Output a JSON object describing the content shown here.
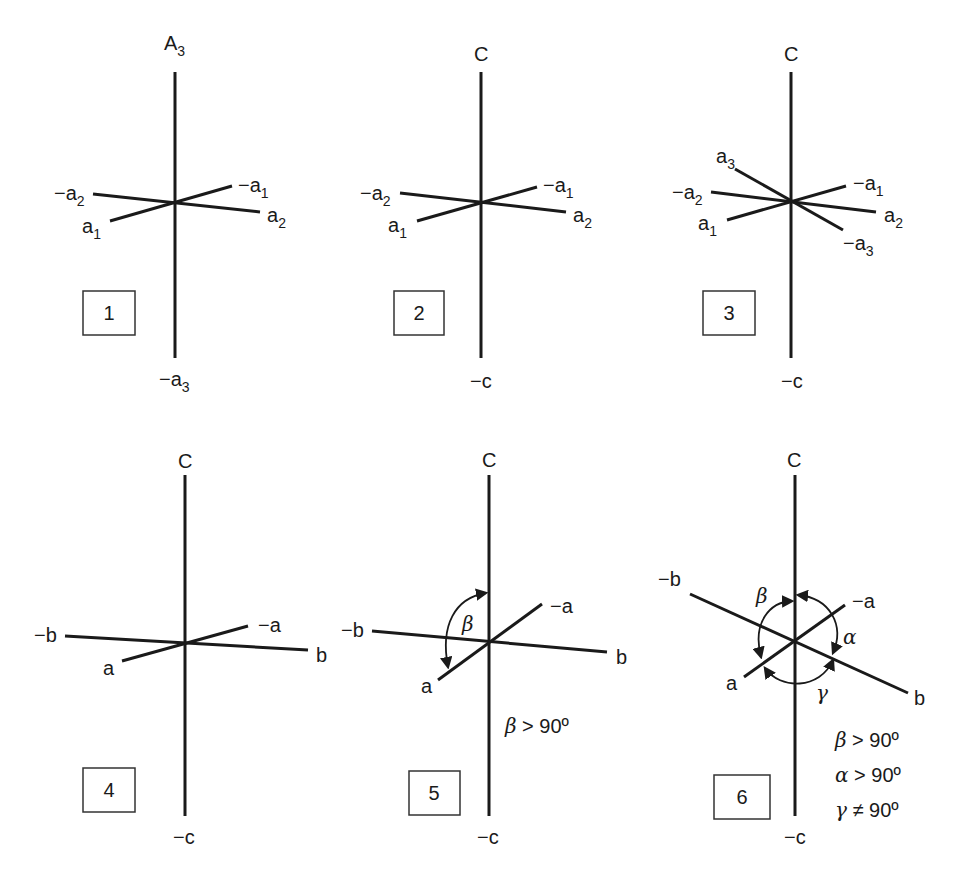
{
  "figure": {
    "panels": [
      {
        "number": "1",
        "axes": {
          "top": "A3",
          "bottom": "−a3",
          "left_upper": "−a2",
          "left_lower": "a1",
          "right_upper": "−a1",
          "right_lower": "a2"
        }
      },
      {
        "number": "2",
        "axes": {
          "top": "C",
          "bottom": "−c",
          "left_upper": "−a2",
          "left_lower": "a1",
          "right_upper": "−a1",
          "right_lower": "a2"
        }
      },
      {
        "number": "3",
        "axes": {
          "top": "C",
          "bottom": "−c",
          "upper_left": "a3",
          "left_upper": "−a2",
          "left_lower": "a1",
          "right_upper": "−a1",
          "right_mid": "a2",
          "lower_right": "−a3"
        }
      },
      {
        "number": "4",
        "axes": {
          "top": "C",
          "bottom": "−c",
          "left": "−b",
          "right": "b",
          "front": "a",
          "back": "−a"
        }
      },
      {
        "number": "5",
        "axes": {
          "top": "C",
          "bottom": "−c",
          "left": "−b",
          "right": "b",
          "front": "a",
          "back": "−a"
        },
        "angles": {
          "beta": "β"
        },
        "conditions": [
          "β > 90º"
        ]
      },
      {
        "number": "6",
        "axes": {
          "top": "C",
          "bottom": "−c",
          "left": "−b",
          "right": "b",
          "front": "a",
          "back": "−a"
        },
        "angles": {
          "beta": "β",
          "alpha": "α",
          "gamma": "γ"
        },
        "conditions": [
          "β > 90º",
          "α > 90º",
          "γ ≠ 90º"
        ]
      }
    ]
  },
  "labels": {
    "p1": {
      "top_main": "A",
      "top_sub": "3",
      "bottom_main": "−a",
      "bottom_sub": "3",
      "l1_main": "−a",
      "l1_sub": "2",
      "l2_main": "a",
      "l2_sub": "1",
      "r1_main": "−a",
      "r1_sub": "1",
      "r2_main": "a",
      "r2_sub": "2"
    },
    "p2": {
      "top": "C",
      "bottom": "−c",
      "l1_main": "−a",
      "l1_sub": "2",
      "l2_main": "a",
      "l2_sub": "1",
      "r1_main": "−a",
      "r1_sub": "1",
      "r2_main": "a",
      "r2_sub": "2"
    },
    "p3": {
      "top": "C",
      "bottom": "−c",
      "u_main": "a",
      "u_sub": "3",
      "l1_main": "−a",
      "l1_sub": "2",
      "l2_main": "a",
      "l2_sub": "1",
      "r1_main": "−a",
      "r1_sub": "1",
      "r2_main": "a",
      "r2_sub": "2",
      "d_main": "−a",
      "d_sub": "3"
    },
    "p4": {
      "top": "C",
      "bottom": "−c",
      "left": "−b",
      "right": "b",
      "front": "a",
      "back": "−a"
    },
    "p5": {
      "top": "C",
      "bottom": "−c",
      "left": "−b",
      "right": "b",
      "front": "a",
      "back": "−a",
      "beta": "β",
      "cond1_sym": "β",
      "cond1_rest": " > 90º"
    },
    "p6": {
      "top": "C",
      "bottom": "−c",
      "left": "−b",
      "right": "b",
      "front": "a",
      "back": "−a",
      "beta": "β",
      "alpha": "α",
      "gamma": "γ",
      "cond1_sym": "β",
      "cond1_rest": " > 90º",
      "cond2_sym": "α",
      "cond2_rest": " > 90º",
      "cond3_sym": "γ",
      "cond3_rest": " ≠ 90º"
    }
  },
  "boxes": {
    "b1": "1",
    "b2": "2",
    "b3": "3",
    "b4": "4",
    "b5": "5",
    "b6": "6"
  }
}
